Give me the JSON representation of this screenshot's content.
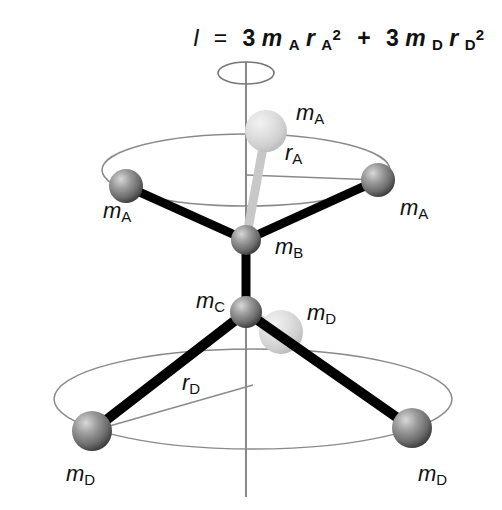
{
  "figure": {
    "background_color": "#ffffff",
    "formula": {
      "symbol_I": "I",
      "equals": "=",
      "term1_coefficient": "3",
      "term1_mass": "m",
      "term1_mass_sub": "A",
      "term1_radius": "r",
      "term1_radius_sub": "A",
      "term1_exponent": "2",
      "plus": "+",
      "term2_coefficient": "3",
      "term2_mass": "m",
      "term2_mass_sub": "D",
      "term2_radius": "r",
      "term2_radius_sub": "D",
      "term2_exponent": "2",
      "plain": "I = 3mA rA^2 + 3mD rD^2"
    },
    "axis": {
      "name": "rotation-axis",
      "color": "#8a8a8a",
      "top_y": 62,
      "bottom_y": 497,
      "x": 246
    },
    "rotation_indicator": {
      "name": "rotation-ellipse",
      "cx": 246,
      "cy": 73,
      "rx": 28,
      "ry": 11,
      "color": "#777777"
    },
    "orbit_upper": {
      "name": "upper-orbit-ellipse",
      "cx": 246,
      "cy": 170,
      "rx": 144,
      "ry": 36,
      "color": "#8a8a8a",
      "radius_label": "r",
      "radius_label_sub": "A"
    },
    "orbit_lower": {
      "name": "lower-orbit-ellipse",
      "cx": 253,
      "cy": 399,
      "rx": 199,
      "ry": 50,
      "color": "#8a8a8a",
      "radius_label": "r",
      "radius_label_sub": "D"
    },
    "colors": {
      "sphere_dark_light": "#cfcfcf",
      "sphere_dark_mid": "#8d8d8d",
      "sphere_dark_edge": "#4a4a4a",
      "sphere_pale_light": "#ededed",
      "sphere_pale_mid": "#d6d6d6",
      "sphere_pale_edge": "#b9b9b9",
      "bond_front": "#000000",
      "bond_back": "#c8c8c8",
      "line_thin": "#8a8a8a",
      "text": "#111111"
    },
    "atoms": [
      {
        "id": "mA-back",
        "label": "m",
        "label_sub": "A",
        "cx": 266,
        "cy": 131,
        "r": 21,
        "shade": "pale",
        "label_x": 296,
        "label_y": 120
      },
      {
        "id": "mA-left",
        "label": "m",
        "label_sub": "A",
        "cx": 126,
        "cy": 186,
        "r": 17,
        "shade": "dark",
        "label_x": 103,
        "label_y": 218
      },
      {
        "id": "mA-right",
        "label": "m",
        "label_sub": "A",
        "cx": 378,
        "cy": 180,
        "r": 17,
        "shade": "dark",
        "label_x": 400,
        "label_y": 215
      },
      {
        "id": "mB",
        "label": "m",
        "label_sub": "B",
        "cx": 246,
        "cy": 240,
        "r": 15,
        "shade": "dark",
        "label_x": 275,
        "label_y": 254
      },
      {
        "id": "mC",
        "label": "m",
        "label_sub": "C",
        "cx": 246,
        "cy": 312,
        "r": 16,
        "shade": "dark",
        "label_x": 196,
        "label_y": 308
      },
      {
        "id": "mD-back",
        "label": "m",
        "label_sub": "D",
        "cx": 281,
        "cy": 332,
        "r": 22,
        "shade": "pale",
        "label_x": 307,
        "label_y": 320
      },
      {
        "id": "mD-left",
        "label": "m",
        "label_sub": "D",
        "cx": 92,
        "cy": 431,
        "r": 20,
        "shade": "dark",
        "label_x": 66,
        "label_y": 481
      },
      {
        "id": "mD-right",
        "label": "m",
        "label_sub": "D",
        "cx": 412,
        "cy": 428,
        "r": 20,
        "shade": "dark",
        "label_x": 418,
        "label_y": 481
      }
    ],
    "bonds": [
      {
        "id": "bond-mB-mA-left",
        "x1": 246,
        "y1": 240,
        "x2": 126,
        "y2": 186,
        "width": 9,
        "style": "front"
      },
      {
        "id": "bond-mB-mA-right",
        "x1": 246,
        "y1": 240,
        "x2": 378,
        "y2": 180,
        "width": 9,
        "style": "front"
      },
      {
        "id": "bond-mB-mA-back",
        "x1": 246,
        "y1": 240,
        "x2": 266,
        "y2": 131,
        "width": 9,
        "style": "back"
      },
      {
        "id": "bond-mB-mC",
        "x1": 246,
        "y1": 240,
        "x2": 246,
        "y2": 312,
        "width": 9,
        "style": "front"
      },
      {
        "id": "bond-mC-mD-left",
        "x1": 246,
        "y1": 312,
        "x2": 92,
        "y2": 431,
        "width": 10,
        "style": "front"
      },
      {
        "id": "bond-mC-mD-right",
        "x1": 246,
        "y1": 312,
        "x2": 412,
        "y2": 428,
        "width": 10,
        "style": "front"
      },
      {
        "id": "bond-mC-mD-back",
        "x1": 246,
        "y1": 312,
        "x2": 281,
        "y2": 332,
        "width": 10,
        "style": "back"
      }
    ],
    "radius_lines": [
      {
        "id": "radius-line-A",
        "x1": 246,
        "y1": 175,
        "x2": 378,
        "y2": 180,
        "label": "rA"
      },
      {
        "id": "radius-line-D",
        "x1": 253,
        "y1": 385,
        "x2": 92,
        "y2": 431,
        "label": "rD"
      }
    ],
    "radius_label_positions": {
      "rA": {
        "x": 285,
        "y": 160
      },
      "rD": {
        "x": 182,
        "y": 390
      }
    }
  }
}
